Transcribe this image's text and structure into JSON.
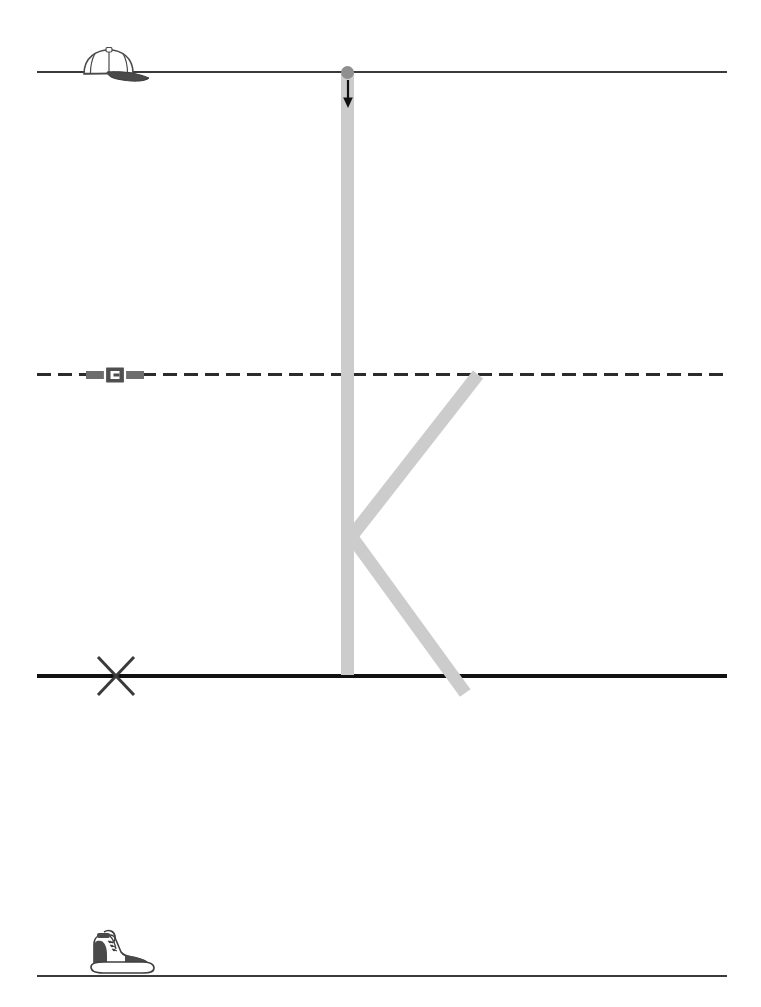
{
  "worksheet": {
    "title": "Handwriting Practice Worksheet",
    "letter": "K",
    "letter_case": "uppercase",
    "stroke_color": "#cccccc",
    "line_color": "#3a3a3a",
    "baseline_color": "#111111",
    "midline_color": "#2b2b2b",
    "start_dot_color": "#8f8f8f",
    "arrow_color": "#111111",
    "background_color": "#ffffff"
  },
  "guide_lines": [
    {
      "name": "top-line",
      "label": "Top line",
      "style": "solid",
      "y": 71,
      "marker": "cap-icon",
      "marker_label": "Baseball cap"
    },
    {
      "name": "mid-line",
      "label": "Dashed midline",
      "style": "dashed",
      "y": 373,
      "marker": "belt-icon",
      "marker_label": "Belt buckle"
    },
    {
      "name": "base-line",
      "label": "Baseline",
      "style": "solid-bold",
      "y": 674,
      "marker": "x-icon",
      "marker_label": "X mark"
    },
    {
      "name": "bottom-line",
      "label": "Bottom line",
      "style": "solid",
      "y": 975,
      "marker": "boot-icon",
      "marker_label": "Hiking boot"
    }
  ],
  "strokes": [
    {
      "name": "stem",
      "label": "Vertical stem",
      "order": 1,
      "from": "top-line",
      "to": "base-line",
      "direction": "down"
    },
    {
      "name": "upper-diagonal",
      "label": "Upper diagonal",
      "order": 2,
      "from": "mid-line",
      "to": "stem-middle",
      "direction": "down-left"
    },
    {
      "name": "lower-diagonal",
      "label": "Lower diagonal",
      "order": 3,
      "from": "stem-middle",
      "to": "base-line",
      "direction": "down-right"
    }
  ],
  "start_marker": {
    "dot_label": "Start here",
    "arrow_label": "Stroke direction down"
  }
}
